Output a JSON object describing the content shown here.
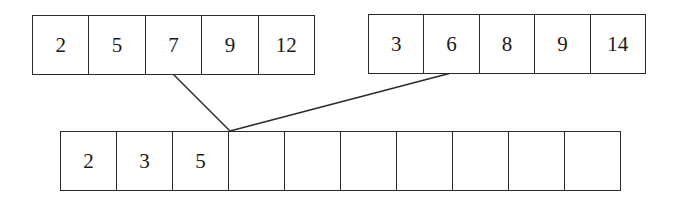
{
  "diagram": {
    "left_input": {
      "values": [
        "2",
        "5",
        "7",
        "9",
        "12"
      ]
    },
    "right_input": {
      "values": [
        "3",
        "6",
        "8",
        "9",
        "14"
      ]
    },
    "output": {
      "values": [
        "2",
        "3",
        "5",
        "",
        "",
        "",
        "",
        "",
        "",
        ""
      ]
    },
    "pointers": [
      {
        "from": "left_input cell 3 (7)",
        "to": "output cell 4"
      },
      {
        "from": "right_input cell 2 (6)",
        "to": "output cell 4"
      }
    ]
  },
  "colors": {
    "stroke": "#2a2a2a",
    "background": "#ffffff",
    "text": "#1a1a1a"
  }
}
